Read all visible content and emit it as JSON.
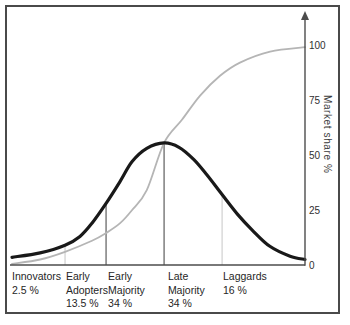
{
  "figure": {
    "y_axis_title": "Market share %",
    "colors": {
      "bell_curve": "#191919",
      "s_curve": "#b5b5b5",
      "axis": "#4c4c4c",
      "boundary_dark": "#3d3d3d",
      "boundary_light": "#c6c6c6",
      "frame": "#4a4a4a",
      "text": "#262626"
    }
  },
  "chart_data": {
    "type": "line",
    "title": "",
    "xlabel": "",
    "ylabel": "Market share %",
    "ylim": [
      0,
      100
    ],
    "yticks": [
      0,
      25,
      50,
      75,
      100
    ],
    "legend": "none",
    "grid": false,
    "series": [
      {
        "name": "adoption-bell-curve",
        "color": "#191919",
        "width": 3.2,
        "x": [
          0,
          9.6,
          18.1,
          23.2,
          27.3,
          32.1,
          36.9,
          41,
          46,
          51.9,
          57,
          62,
          66.5,
          71.7,
          77,
          81.9,
          88,
          94.9,
          100
        ],
        "values": [
          3.5,
          5.5,
          9,
          13,
          19,
          28,
          38,
          47,
          53,
          55.5,
          53.5,
          48,
          41,
          32,
          23,
          16,
          8.5,
          4,
          2.5
        ]
      },
      {
        "name": "cumulative-market-share",
        "color": "#b5b5b5",
        "width": 1.8,
        "x": [
          0,
          9.6,
          18.1,
          27.3,
          32.1,
          36.9,
          41,
          46,
          51.9,
          58,
          64.2,
          71,
          77.8,
          88.1,
          100
        ],
        "values": [
          0.5,
          2.5,
          6,
          11,
          14.5,
          19,
          25,
          34,
          55.5,
          66,
          77,
          86,
          92,
          97,
          99
        ]
      }
    ],
    "boundaries": [
      {
        "x": 18.1,
        "top": 9,
        "shade": "light"
      },
      {
        "x": 32.1,
        "top": 28,
        "shade": "dark"
      },
      {
        "x": 51.9,
        "top": 55.5,
        "shade": "dark"
      },
      {
        "x": 71.7,
        "top": 32,
        "shade": "light"
      }
    ],
    "categories": [
      {
        "x": 0,
        "label_lines": [
          "Innovators",
          "2.5 %"
        ]
      },
      {
        "x": 18.4,
        "label_lines": [
          "Early",
          "Adopters",
          "13.5 %"
        ]
      },
      {
        "x": 32.8,
        "label_lines": [
          "Early",
          "Majority",
          "34 %"
        ]
      },
      {
        "x": 53.2,
        "label_lines": [
          "Late",
          "Majority",
          "34 %"
        ]
      },
      {
        "x": 72.0,
        "label_lines": [
          "Laggards",
          "16 %"
        ]
      }
    ]
  }
}
